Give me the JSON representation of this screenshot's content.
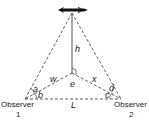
{
  "diagram": {
    "labels": {
      "h": "h",
      "w": "w",
      "e": "e",
      "x": "x",
      "a": "a",
      "b": "b",
      "c": "c",
      "d": "d",
      "L": "L"
    },
    "observers": [
      {
        "name": "Observer",
        "number": "1"
      },
      {
        "name": "Observer",
        "number": "2"
      }
    ],
    "icons": {
      "target": "rocket-icon"
    },
    "colors": {
      "line": "#333333",
      "target": "#111111"
    }
  }
}
